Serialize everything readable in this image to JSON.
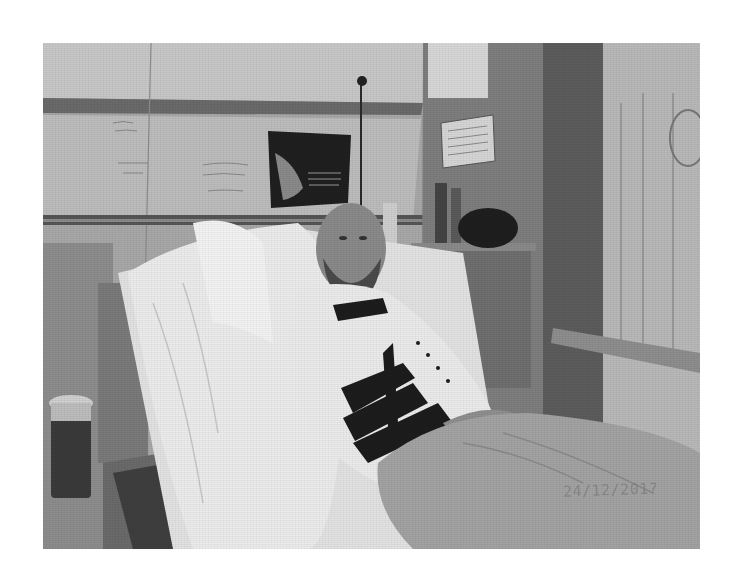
{
  "photo": {
    "description": "Grayscale photograph of a bearded man lying in a hospital bed, wearing a white sweater with dark geometric pattern, propped on white pillows, covered by a blanket",
    "color_mode": "grayscale",
    "date_stamp": "24/12/201?",
    "elements": {
      "person": "bearded man with shaved head reclining in bed",
      "sweater": "white sweater with black geometric/arrow pattern",
      "pillows": "white pillows behind the man",
      "blanket": "gray blanket over legs",
      "wall_poster": "dark poster with figure and small text, above bed",
      "wall_notice": "small white notice sign on right wall",
      "whiteboard": "whiteboard with illegible handwriting, left wall",
      "cup": "thermos cup on left side table",
      "nightstand": "bedside table with bottles and dark bag",
      "curtain": "hospital curtain on right",
      "bed_rail": "bed side rail, bottom right",
      "wall_rail": "horizontal wall rail behind bed"
    },
    "colors": {
      "wall": "#b4b4b4",
      "dark_wall": "#6e6e6e",
      "pillow": "#e6e6e6",
      "sweater": "#e9e9e9",
      "pattern": "#1e1e1e",
      "blanket": "#a2a2a2",
      "skin": "#8a8a8a"
    }
  }
}
